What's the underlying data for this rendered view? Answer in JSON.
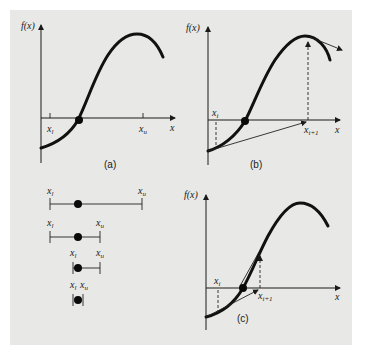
{
  "figure": {
    "background_color": "#e8e8e6",
    "curve_color": "#111111",
    "panels": [
      {
        "id": "a",
        "caption": "(a)",
        "y_axis_label": "f(x)",
        "x_axis_label": "x",
        "markers": [
          {
            "label": "x",
            "subscript": "l"
          },
          {
            "label": "x",
            "subscript": "u"
          }
        ],
        "description": "Bracketing: function changes sign between lower bound x_l and upper bound x_u; root marked with a dot"
      },
      {
        "id": "b",
        "caption": "(b)",
        "y_axis_label": "f(x)",
        "x_axis_label": "x",
        "markers": [
          {
            "label": "x",
            "subscript": "i"
          },
          {
            "label": "x",
            "subscript": "i+1"
          }
        ],
        "description": "Open method diverging: tangent/extrapolation from x_i shoots to x_{i+1} away from the root"
      },
      {
        "id": "c",
        "caption": "(c)",
        "y_axis_label": "f(x)",
        "x_axis_label": "x",
        "markers": [
          {
            "label": "x",
            "subscript": "i"
          },
          {
            "label": "x",
            "subscript": "i+1"
          }
        ],
        "description": "Open method converging: x_{i+1} moves toward the root"
      }
    ],
    "bracket_sequence": {
      "description": "Successive bracket intervals shrinking around the root",
      "rows": [
        {
          "left": {
            "label": "x",
            "subscript": "l"
          },
          "right": {
            "label": "x",
            "subscript": "u"
          }
        },
        {
          "left": {
            "label": "x",
            "subscript": "l"
          },
          "right": {
            "label": "x",
            "subscript": "u"
          }
        },
        {
          "left": {
            "label": "x",
            "subscript": "l"
          },
          "right": {
            "label": "x",
            "subscript": "u"
          }
        },
        {
          "left": {
            "label": "x",
            "subscript": "l"
          },
          "right": {
            "label": "x",
            "subscript": "u"
          }
        }
      ]
    }
  }
}
